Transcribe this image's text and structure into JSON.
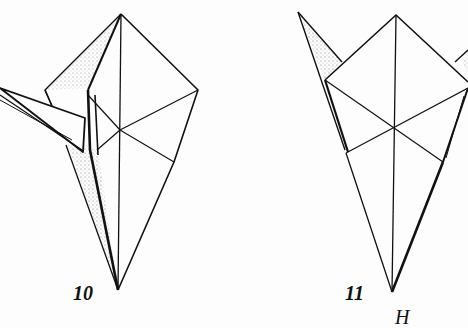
{
  "diagram": {
    "type": "origami-instruction-steps",
    "steps": [
      {
        "number": "10",
        "description": "crane base with folded neck/head to the left"
      },
      {
        "number": "11",
        "description": "crane base with tips folded up at sides"
      }
    ],
    "partial_label": "H",
    "colors": {
      "line": "#111111",
      "paper": "#fdfdfd",
      "shade": "#555555"
    }
  }
}
